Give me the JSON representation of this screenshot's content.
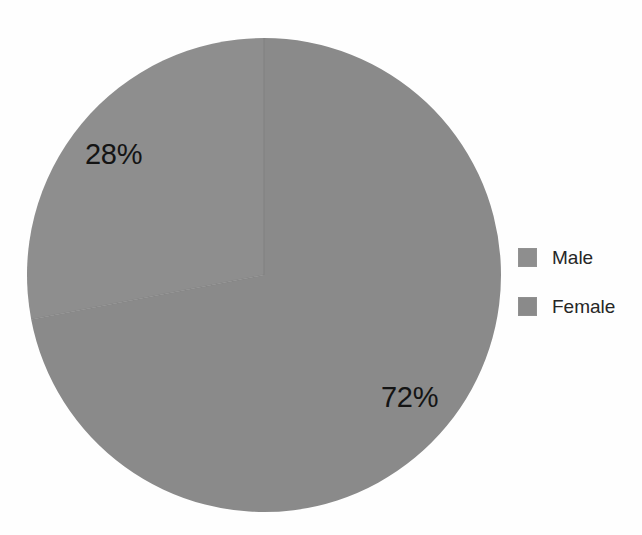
{
  "chart_data": {
    "type": "pie",
    "title": "",
    "categories": [
      "Male",
      "Female"
    ],
    "values": [
      28,
      72
    ],
    "value_labels": [
      "28%",
      "72%"
    ],
    "units": "percent",
    "legend_position": "right",
    "grid": false,
    "start_angle_deg": 0,
    "direction": "counterclockwise-for-first-slice",
    "slice_colors": [
      "#8e8e8e",
      "#8a8a8a"
    ],
    "label_color": "#141414",
    "background_color": "#fefefe",
    "series": [
      {
        "name": "Gender distribution",
        "points": [
          {
            "category": "Male",
            "value": 28,
            "label": "28%",
            "color": "#8e8e8e"
          },
          {
            "category": "Female",
            "value": 72,
            "label": "72%",
            "color": "#8a8a8a"
          }
        ]
      }
    ]
  },
  "labels": {
    "male_pct": "28%",
    "female_pct": "72%"
  },
  "legend": {
    "items": [
      {
        "label": "Male",
        "color": "#8e8e8e"
      },
      {
        "label": "Female",
        "color": "#8a8a8a"
      }
    ]
  }
}
